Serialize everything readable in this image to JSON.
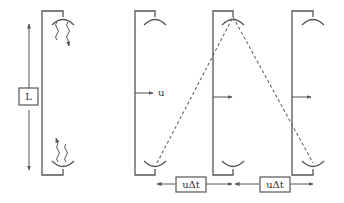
{
  "diagram": {
    "colors": {
      "stroke": "#555555",
      "dash": "#666666",
      "background": "#ffffff"
    },
    "stationary_clock": {
      "length_label": "L",
      "photon_direction": "wavy light bouncing between mirrors"
    },
    "moving_clocks": {
      "velocity_label": "u",
      "positions": 3
    },
    "displacement_labels": [
      "uΔt",
      "uΔt"
    ]
  }
}
